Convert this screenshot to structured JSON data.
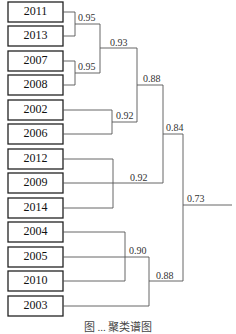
{
  "diagram": {
    "type": "dendrogram",
    "leaves": [
      "2011",
      "2013",
      "2007",
      "2008",
      "2002",
      "2006",
      "2012",
      "2009",
      "2014",
      "2004",
      "2005",
      "2010",
      "2003"
    ],
    "nodes": [
      {
        "label": "0.95",
        "joins": [
          "2011",
          "2013"
        ]
      },
      {
        "label": "0.95",
        "joins": [
          "2007",
          "2008"
        ]
      },
      {
        "label": "0.93",
        "joins": [
          "2011-2013",
          "2007-2008"
        ]
      },
      {
        "label": "0.92",
        "joins": [
          "2002",
          "2006"
        ]
      },
      {
        "label": "0.88",
        "joins": [
          "2011-2008 cluster",
          "2002-2006"
        ]
      },
      {
        "label": "0.92",
        "joins": [
          "2012-2014",
          "2009"
        ]
      },
      {
        "label": "0.84",
        "joins": [
          "0.88 cluster",
          "2009 cluster"
        ]
      },
      {
        "label": "0.90",
        "joins": [
          "2004-2010",
          "2005"
        ]
      },
      {
        "label": "0.88",
        "joins": [
          "2004-2005-2010",
          "2003"
        ]
      },
      {
        "label": "0.73",
        "joins": [
          "0.84 cluster",
          "0.88 cluster (2003)"
        ]
      }
    ],
    "caption": "图 ... 聚类谱图"
  }
}
